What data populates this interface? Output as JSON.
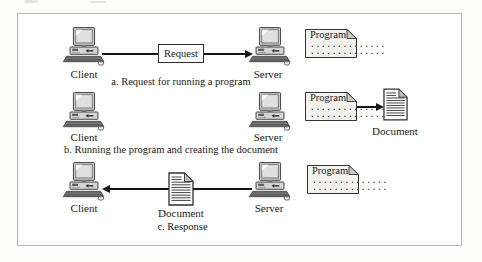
{
  "figure": {
    "rows": {
      "a": {
        "caption": "a. Request for running a program",
        "client_label": "Client",
        "server_label": "Server",
        "request_label": "Request",
        "program_card": {
          "title": "Program",
          "dots_line_1": "..............",
          "dots_line_2": ".............."
        }
      },
      "b": {
        "caption": "b. Running the program and creating the document",
        "client_label": "Client",
        "server_label": "Server",
        "program_card": {
          "title": "Program",
          "dots_line_1": "..............",
          "dots_line_2": ".............."
        },
        "document_label": "Document"
      },
      "c": {
        "caption": "c. Response",
        "client_label": "Client",
        "server_label": "Server",
        "program_card": {
          "title": "Program",
          "dots_line_1": "..............",
          "dots_line_2": ".............."
        },
        "document_label": "Document"
      }
    },
    "icons": {
      "computer": "desktop-computer-icon",
      "document": "document-page-icon",
      "program_card": "program-note-card"
    },
    "colors": {
      "frame_border": "#b3b3b3",
      "ink": "#1c1c1c",
      "card_bg": "#f2f2ee",
      "card_fold": "#c9c9c9",
      "arrow": "#151515"
    }
  }
}
